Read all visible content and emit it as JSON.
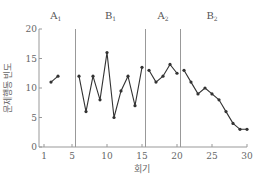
{
  "chart_data": {
    "type": "line",
    "title": "",
    "xlabel": "회기",
    "ylabel": "문제행동 빈도",
    "xlim": [
      0,
      30
    ],
    "ylim": [
      0,
      20
    ],
    "x_ticks": [
      1,
      5,
      10,
      15,
      20,
      25,
      30
    ],
    "y_ticks": [
      0,
      5,
      10,
      15,
      20
    ],
    "grid": false,
    "legend": null,
    "phase_lines": [
      5.5,
      15.5,
      20.5
    ],
    "phases": [
      {
        "name": "A1",
        "label_main": "A",
        "label_sub": "1",
        "x_center": 2.7
      },
      {
        "name": "B1",
        "label_main": "B",
        "label_sub": "1",
        "x_center": 10.5
      },
      {
        "name": "A2",
        "label_main": "A",
        "label_sub": "2",
        "x_center": 18
      },
      {
        "name": "B2",
        "label_main": "B",
        "label_sub": "2",
        "x_center": 25
      }
    ],
    "series": [
      {
        "name": "A1",
        "x": [
          2,
          3
        ],
        "values": [
          11,
          12
        ]
      },
      {
        "name": "B1",
        "x": [
          6,
          7,
          8,
          9,
          10,
          11,
          12,
          13,
          14,
          15
        ],
        "values": [
          12,
          6,
          12,
          8,
          16,
          5,
          9.5,
          12,
          7,
          13.5
        ]
      },
      {
        "name": "A2",
        "x": [
          16,
          17,
          18,
          19,
          20
        ],
        "values": [
          13,
          11,
          12,
          14,
          12.5
        ]
      },
      {
        "name": "B2",
        "x": [
          21,
          22,
          23,
          24,
          25,
          26,
          27,
          28,
          29,
          30
        ],
        "values": [
          13,
          11,
          9,
          10,
          9,
          8,
          6,
          4,
          3,
          3
        ]
      }
    ]
  },
  "colors": {
    "line": "#333333",
    "axis": "#999999",
    "phase_line": "#999999"
  }
}
